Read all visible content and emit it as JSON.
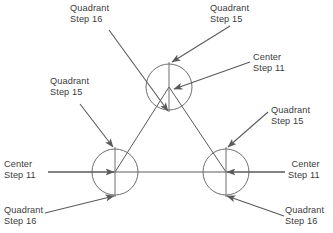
{
  "figure": {
    "colors": {
      "line": "#5a5a5a",
      "circle": "#6e6e6e",
      "text": "#3b3b3b",
      "background": "#ffffff"
    },
    "geometry": {
      "circle_radius": 23,
      "circles": [
        {
          "name": "top-circle",
          "cx": 169,
          "cy": 87
        },
        {
          "name": "left-circle",
          "cx": 115,
          "cy": 172
        },
        {
          "name": "right-circle",
          "cx": 226,
          "cy": 172
        }
      ],
      "baseline": {
        "y": 172,
        "x1": 48,
        "x2": 285
      }
    }
  },
  "annotations": [
    {
      "id": "top-left-quadrant",
      "line1": "Quadrant",
      "line2": "Step 16",
      "target": "top-circle-bottom"
    },
    {
      "id": "top-right-quadrant",
      "line1": "Quadrant",
      "line2": "Step 15",
      "target": "top-circle-top"
    },
    {
      "id": "right-upper-center",
      "line1": "Center",
      "line2": "Step 11",
      "target": "top-circle-center"
    },
    {
      "id": "left-middle-quadrant",
      "line1": "Quadrant",
      "line2": "Step 15",
      "target": "left-circle-top"
    },
    {
      "id": "right-middle-quadrant",
      "line1": "Quadrant",
      "line2": "Step 15",
      "target": "right-circle-top"
    },
    {
      "id": "left-center",
      "line1": "Center",
      "line2": "Step 11",
      "target": "left-circle-center"
    },
    {
      "id": "right-center",
      "line1": "Center",
      "line2": "Step 11",
      "target": "right-circle-center"
    },
    {
      "id": "bottom-left-quadrant",
      "line1": "Quadrant",
      "line2": "Step 16",
      "target": "left-circle-bottom"
    },
    {
      "id": "bottom-right-quadrant",
      "line1": "Quadrant",
      "line2": "Step 16",
      "target": "right-circle-bottom"
    }
  ]
}
